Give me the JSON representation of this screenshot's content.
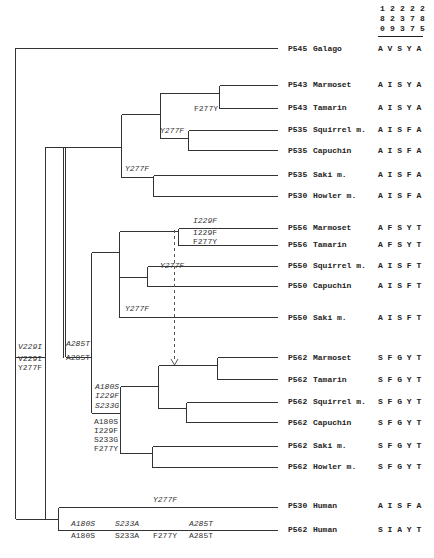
{
  "column_header": {
    "positions": [
      "180",
      "229",
      "233",
      "277",
      "285"
    ]
  },
  "taxa": [
    {
      "id": "P545",
      "name": "Galago",
      "seq": "A V S Y A",
      "y": 49
    },
    {
      "id": "P543",
      "name": "Marmoset",
      "seq": "A I S Y A",
      "y": 85
    },
    {
      "id": "P543",
      "name": "Tamarin",
      "seq": "A I S Y A",
      "y": 108
    },
    {
      "id": "P535",
      "name": "Squirrel m.",
      "seq": "A I S F A",
      "y": 130
    },
    {
      "id": "P535",
      "name": "Capuchin",
      "seq": "A I S F A",
      "y": 151
    },
    {
      "id": "P535",
      "name": "Saki m.",
      "seq": "A I S F A",
      "y": 175
    },
    {
      "id": "P530",
      "name": "Howler m.",
      "seq": "A I S F A",
      "y": 196
    },
    {
      "id": "P556",
      "name": "Marmoset",
      "seq": "A F S Y T",
      "y": 228
    },
    {
      "id": "P556",
      "name": "Tamarin",
      "seq": "A F S Y T",
      "y": 245
    },
    {
      "id": "P550",
      "name": "Squirrel m.",
      "seq": "A I S F T",
      "y": 266
    },
    {
      "id": "P550",
      "name": "Capuchin",
      "seq": "A I S F T",
      "y": 286
    },
    {
      "id": "P550",
      "name": "Saki m.",
      "seq": "A I S F T",
      "y": 318
    },
    {
      "id": "P562",
      "name": "Marmoset",
      "seq": "S F G Y T",
      "y": 358
    },
    {
      "id": "P562",
      "name": "Tamarin",
      "seq": "S F G Y T",
      "y": 380
    },
    {
      "id": "P562",
      "name": "Squirrel m.",
      "seq": "S F G Y T",
      "y": 402
    },
    {
      "id": "P562",
      "name": "Capuchin",
      "seq": "S F G Y T",
      "y": 423
    },
    {
      "id": "P562",
      "name": "Saki m.",
      "seq": "S F G Y T",
      "y": 446
    },
    {
      "id": "P562",
      "name": "Howler m.",
      "seq": "S F G Y T",
      "y": 467
    },
    {
      "id": "P530",
      "name": "Human",
      "seq": "A I S F A",
      "y": 506
    },
    {
      "id": "P562",
      "name": "Human",
      "seq": "S I A Y T",
      "y": 530
    }
  ],
  "mutations": [
    {
      "text": "F277Y",
      "x": 194,
      "y": 111,
      "italic": false
    },
    {
      "text": "Y277F",
      "x": 160,
      "y": 133,
      "italic": true
    },
    {
      "text": "Y277F",
      "x": 125,
      "y": 171,
      "italic": true
    },
    {
      "text": "I229F",
      "x": 193,
      "y": 223,
      "italic": true
    },
    {
      "text": "I229F",
      "x": 193,
      "y": 235,
      "italic": false
    },
    {
      "text": "F277Y",
      "x": 193,
      "y": 244,
      "italic": false
    },
    {
      "text": "Y277F",
      "x": 160,
      "y": 268,
      "italic": true
    },
    {
      "text": "Y277F",
      "x": 125,
      "y": 311,
      "italic": true
    },
    {
      "text": "V229I",
      "x": 18,
      "y": 349,
      "italic": true
    },
    {
      "text": "V229I",
      "x": 18,
      "y": 361,
      "italic": false
    },
    {
      "text": "Y277F",
      "x": 18,
      "y": 370,
      "italic": false
    },
    {
      "text": "A285T",
      "x": 66,
      "y": 346,
      "italic": true
    },
    {
      "text": "A285T",
      "x": 66,
      "y": 360,
      "italic": false
    },
    {
      "text": "A180S",
      "x": 95,
      "y": 389,
      "italic": true
    },
    {
      "text": "I229F",
      "x": 95,
      "y": 398,
      "italic": true
    },
    {
      "text": "S233G",
      "x": 95,
      "y": 408,
      "italic": true
    },
    {
      "text": "A180S",
      "x": 94,
      "y": 424,
      "italic": false
    },
    {
      "text": "I229F",
      "x": 94,
      "y": 433,
      "italic": false
    },
    {
      "text": "S233G",
      "x": 94,
      "y": 442,
      "italic": false
    },
    {
      "text": "F277Y",
      "x": 94,
      "y": 451,
      "italic": false
    },
    {
      "text": "Y277F",
      "x": 153,
      "y": 502,
      "italic": true
    },
    {
      "text": "A180S",
      "x": 71,
      "y": 526,
      "italic": true
    },
    {
      "text": "S233A",
      "x": 115,
      "y": 526,
      "italic": true
    },
    {
      "text": "A285T",
      "x": 189,
      "y": 526,
      "italic": true
    },
    {
      "text": "A180S",
      "x": 71,
      "y": 538,
      "italic": false
    },
    {
      "text": "S233A",
      "x": 115,
      "y": 538,
      "italic": false
    },
    {
      "text": "F277Y",
      "x": 153,
      "y": 538,
      "italic": false
    },
    {
      "text": "A285T",
      "x": 189,
      "y": 538,
      "italic": false
    }
  ]
}
